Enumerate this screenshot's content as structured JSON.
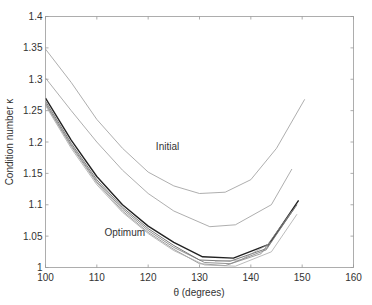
{
  "chart_data": {
    "type": "line",
    "title": "",
    "xlabel": "θ  (degrees)",
    "ylabel": "Condition number κ",
    "xlim": [
      100,
      160
    ],
    "ylim": [
      1,
      1.4
    ],
    "xticks": [
      100,
      110,
      120,
      130,
      140,
      150,
      160
    ],
    "xtick_labels": [
      "100",
      "110",
      "120",
      "130",
      "140",
      "150",
      "160"
    ],
    "yticks": [
      1,
      1.05,
      1.1,
      1.15,
      1.2,
      1.25,
      1.3,
      1.35,
      1.4
    ],
    "ytick_labels": [
      "1",
      "1.05",
      "1.1",
      "1.15",
      "1.2",
      "1.25",
      "1.3",
      "1.35",
      "1.4"
    ],
    "grid": false,
    "legend": null,
    "annotations": [
      {
        "text": "Initial",
        "x": 121.5,
        "y": 1.188
      },
      {
        "text": "Optimum",
        "x": 111.5,
        "y": 1.05
      }
    ],
    "series": [
      {
        "name": "Initial (upper)",
        "color": "#999999",
        "width": 0.8,
        "x": [
          100,
          105,
          110,
          115,
          120,
          125,
          130,
          135,
          140,
          145,
          150.5
        ],
        "y": [
          1.348,
          1.295,
          1.236,
          1.19,
          1.152,
          1.13,
          1.118,
          1.12,
          1.14,
          1.19,
          1.268
        ]
      },
      {
        "name": "Initial (lower)",
        "color": "#999999",
        "width": 0.8,
        "x": [
          100,
          105,
          110,
          115,
          120,
          125,
          132,
          137,
          144,
          148
        ],
        "y": [
          1.302,
          1.25,
          1.2,
          1.155,
          1.118,
          1.09,
          1.065,
          1.068,
          1.1,
          1.157
        ]
      },
      {
        "name": "Optimum 1",
        "color": "#222222",
        "width": 1.4,
        "x": [
          100,
          105,
          110,
          115,
          120,
          125,
          130.6,
          136.6,
          143.5,
          149.3
        ],
        "y": [
          1.27,
          1.203,
          1.145,
          1.1,
          1.066,
          1.04,
          1.017,
          1.015,
          1.037,
          1.107
        ]
      },
      {
        "name": "Optimum 2",
        "color": "#555555",
        "width": 0.8,
        "x": [
          100,
          105,
          110,
          115,
          120,
          125,
          130,
          136,
          143,
          149
        ],
        "y": [
          1.265,
          1.198,
          1.14,
          1.096,
          1.062,
          1.035,
          1.012,
          1.01,
          1.03,
          1.1
        ]
      },
      {
        "name": "Optimum 3",
        "color": "#777777",
        "width": 0.8,
        "x": [
          100,
          105,
          110,
          115,
          120,
          125,
          131,
          136,
          143,
          148.5
        ],
        "y": [
          1.262,
          1.195,
          1.137,
          1.093,
          1.059,
          1.032,
          1.008,
          1.006,
          1.028,
          1.095
        ]
      },
      {
        "name": "Optimum 4",
        "color": "#888888",
        "width": 0.8,
        "x": [
          100,
          105,
          110,
          115,
          120,
          125,
          130,
          135,
          142,
          148
        ],
        "y": [
          1.26,
          1.193,
          1.135,
          1.09,
          1.056,
          1.029,
          1.006,
          1.003,
          1.022,
          1.09
        ]
      },
      {
        "name": "Optimum 5",
        "color": "#aaaaaa",
        "width": 0.8,
        "x": [
          100,
          105,
          110,
          115,
          120,
          125,
          131,
          137,
          144,
          149
        ],
        "y": [
          1.258,
          1.19,
          1.132,
          1.088,
          1.054,
          1.027,
          1.004,
          1.002,
          1.025,
          1.085
        ]
      },
      {
        "name": "Optimum 6",
        "color": "#999999",
        "width": 0.7,
        "x": [
          133,
          138,
          144
        ],
        "y": [
          1.01,
          1.012,
          1.04
        ]
      }
    ]
  }
}
